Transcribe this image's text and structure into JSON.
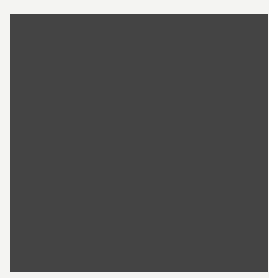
{
  "puzzle": {
    "rows": 15,
    "cols": 15,
    "colors": {
      "black": "#1c1c1c",
      "white": "#fbfbfa",
      "line": "#444444"
    },
    "layout": [
      "11111011111011 1",
      "x"
    ],
    "grid": [
      "....#.....#...",
      "x"
    ]
  }
}
